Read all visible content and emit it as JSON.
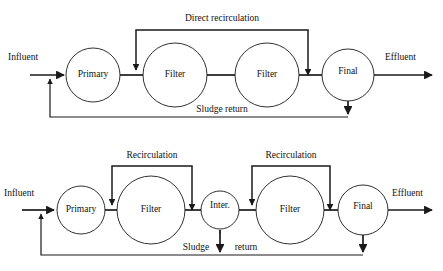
{
  "figure": {
    "background_color": "#ffffff",
    "ink_color": "#1a1a1a"
  },
  "diagrams": [
    {
      "id": "two-stage-trickling-filter",
      "units": [
        {
          "name": "primary-clarifier",
          "label": "Primary",
          "cx": 93,
          "cy": 75,
          "r": 27
        },
        {
          "name": "filter-first",
          "label": "Filter",
          "cx": 175,
          "cy": 75,
          "r": 32
        },
        {
          "name": "filter-second",
          "label": "Filter",
          "cx": 267,
          "cy": 75,
          "r": 32
        },
        {
          "name": "final-clarifier",
          "label": "Final",
          "cx": 348,
          "cy": 75,
          "r": 26
        }
      ],
      "io": [
        {
          "name": "influent-label",
          "label": "Influent",
          "x": 8,
          "y": 60
        },
        {
          "name": "effluent-label",
          "label": "Effluent",
          "x": 385,
          "y": 60
        }
      ],
      "annotations": [
        {
          "name": "direct-recirculation-label",
          "label": "Direct recirculation",
          "x": 222,
          "y": 21
        },
        {
          "name": "sludge-return-label",
          "label": "Sludge return",
          "x": 222,
          "y": 112
        }
      ]
    },
    {
      "id": "two-stage-with-intermediate-clarifier",
      "units": [
        {
          "name": "primary-clarifier",
          "label": "Primary",
          "cx": 81,
          "cy": 210,
          "r": 24
        },
        {
          "name": "filter-first",
          "label": "Filter",
          "cx": 151,
          "cy": 210,
          "r": 34
        },
        {
          "name": "intermediate-clarifier",
          "label": "Inter.",
          "cx": 220,
          "cy": 210,
          "r": 19
        },
        {
          "name": "filter-second",
          "label": "Filter",
          "cx": 290,
          "cy": 210,
          "r": 34
        },
        {
          "name": "final-clarifier",
          "label": "Final",
          "cx": 363,
          "cy": 210,
          "r": 25
        }
      ],
      "io": [
        {
          "name": "influent-label",
          "label": "Influent",
          "x": 4,
          "y": 196
        },
        {
          "name": "effluent-label",
          "label": "Effluent",
          "x": 392,
          "y": 196
        }
      ],
      "annotations": [
        {
          "name": "recirculation-label-first",
          "label": "Recirculation",
          "x": 152,
          "y": 158
        },
        {
          "name": "recirculation-label-second",
          "label": "Recirculation",
          "x": 291,
          "y": 158
        },
        {
          "name": "sludge-word",
          "label": "Sludge",
          "x": 196,
          "y": 250
        },
        {
          "name": "return-word",
          "label": "return",
          "x": 246,
          "y": 250
        }
      ]
    }
  ]
}
